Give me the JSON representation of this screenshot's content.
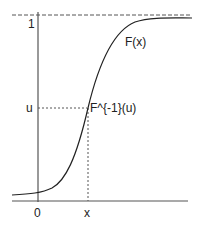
{
  "diagram": {
    "labels": {
      "y_one": "1",
      "y_u": "u",
      "x_zero": "0",
      "x_x": "x",
      "curve": "F(x)",
      "inverse": "F^{-1}(u)"
    },
    "colors": {
      "axis": "#555555",
      "curve": "#222222",
      "dashed": "#555555"
    }
  }
}
